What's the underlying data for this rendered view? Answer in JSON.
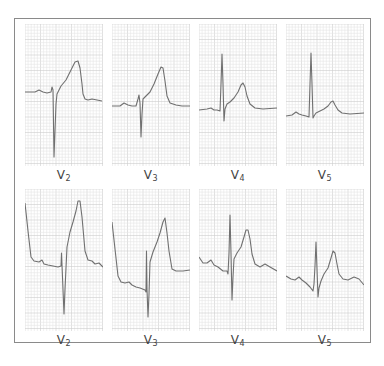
{
  "figure": {
    "colors": {
      "frame": "#8a8a8a",
      "grid_minor": "#e6e6e6",
      "grid_major": "#cdcdcd",
      "trace": "#707070",
      "label": "#444444"
    }
  },
  "rows": [
    {
      "panels": [
        {
          "lead": "V",
          "sub": "2",
          "trace": [
            [
              0,
              68
            ],
            [
              10,
              68
            ],
            [
              14,
              66
            ],
            [
              18,
              68
            ],
            [
              22,
              69
            ],
            [
              26,
              68
            ],
            [
              27,
              63
            ],
            [
              28,
              66
            ],
            [
              29,
              133
            ],
            [
              31,
              80
            ],
            [
              32,
              70
            ],
            [
              36,
              62
            ],
            [
              41,
              56
            ],
            [
              46,
              46
            ],
            [
              50,
              38
            ],
            [
              53,
              37
            ],
            [
              55,
              44
            ],
            [
              57,
              60
            ],
            [
              58,
              70
            ],
            [
              60,
              75
            ],
            [
              63,
              76
            ],
            [
              67,
              75
            ],
            [
              72,
              76
            ],
            [
              77,
              77
            ]
          ]
        },
        {
          "lead": "V",
          "sub": "3",
          "trace": [
            [
              0,
              82
            ],
            [
              8,
              82
            ],
            [
              12,
              79
            ],
            [
              16,
              81
            ],
            [
              20,
              82
            ],
            [
              24,
              82
            ],
            [
              26,
              75
            ],
            [
              27,
              71
            ],
            [
              28,
              79
            ],
            [
              29,
              113
            ],
            [
              30,
              90
            ],
            [
              31,
              75
            ],
            [
              34,
              72
            ],
            [
              38,
              68
            ],
            [
              42,
              60
            ],
            [
              46,
              50
            ],
            [
              49,
              43
            ],
            [
              51,
              44
            ],
            [
              53,
              57
            ],
            [
              55,
              72
            ],
            [
              58,
              79
            ],
            [
              64,
              81
            ],
            [
              70,
              82
            ],
            [
              78,
              82
            ]
          ]
        },
        {
          "lead": "V",
          "sub": "4",
          "trace": [
            [
              0,
              86
            ],
            [
              8,
              85
            ],
            [
              12,
              84
            ],
            [
              15,
              86
            ],
            [
              18,
              86
            ],
            [
              21,
              87
            ],
            [
              22,
              60
            ],
            [
              23,
              30
            ],
            [
              24,
              60
            ],
            [
              25,
              97
            ],
            [
              26,
              85
            ],
            [
              28,
              80
            ],
            [
              31,
              78
            ],
            [
              35,
              74
            ],
            [
              39,
              68
            ],
            [
              42,
              61
            ],
            [
              44,
              59
            ],
            [
              46,
              63
            ],
            [
              48,
              72
            ],
            [
              51,
              80
            ],
            [
              56,
              84
            ],
            [
              64,
              85
            ],
            [
              78,
              84
            ]
          ]
        },
        {
          "lead": "V",
          "sub": "5",
          "trace": [
            [
              0,
              92
            ],
            [
              6,
              91
            ],
            [
              10,
              88
            ],
            [
              13,
              90
            ],
            [
              16,
              91
            ],
            [
              20,
              92
            ],
            [
              23,
              93
            ],
            [
              24,
              60
            ],
            [
              25,
              29
            ],
            [
              26,
              60
            ],
            [
              27,
              94
            ],
            [
              28,
              92
            ],
            [
              30,
              89
            ],
            [
              34,
              87
            ],
            [
              38,
              85
            ],
            [
              42,
              82
            ],
            [
              45,
              78
            ],
            [
              47,
              77
            ],
            [
              49,
              81
            ],
            [
              52,
              86
            ],
            [
              56,
              89
            ],
            [
              64,
              90
            ],
            [
              78,
              89
            ]
          ]
        }
      ]
    },
    {
      "panels": [
        {
          "lead": "V",
          "sub": "2",
          "trace": [
            [
              0,
              14
            ],
            [
              3,
              42
            ],
            [
              6,
              68
            ],
            [
              9,
              72
            ],
            [
              14,
              73
            ],
            [
              17,
              71
            ],
            [
              19,
              75
            ],
            [
              23,
              76
            ],
            [
              28,
              77
            ],
            [
              33,
              78
            ],
            [
              36,
              77
            ],
            [
              36.5,
              64
            ],
            [
              37,
              76
            ],
            [
              39,
              125
            ],
            [
              40,
              100
            ],
            [
              42,
              58
            ],
            [
              45,
              43
            ],
            [
              48,
              33
            ],
            [
              51,
              22
            ],
            [
              53,
              12
            ],
            [
              55,
              12
            ],
            [
              57,
              28
            ],
            [
              60,
              62
            ],
            [
              63,
              71
            ],
            [
              67,
              72
            ],
            [
              70,
              75
            ],
            [
              74,
              74
            ],
            [
              78,
              78
            ]
          ]
        },
        {
          "lead": "V",
          "sub": "3",
          "trace": [
            [
              0,
              33
            ],
            [
              3,
              60
            ],
            [
              6,
              87
            ],
            [
              9,
              93
            ],
            [
              13,
              94
            ],
            [
              17,
              93
            ],
            [
              20,
              96
            ],
            [
              24,
              98
            ],
            [
              28,
              99
            ],
            [
              33,
              101
            ],
            [
              34,
              103
            ],
            [
              34.5,
              62
            ],
            [
              35,
              100
            ],
            [
              36,
              128
            ],
            [
              37,
              105
            ],
            [
              38,
              73
            ],
            [
              41,
              63
            ],
            [
              45,
              53
            ],
            [
              48,
              44
            ],
            [
              51,
              33
            ],
            [
              53,
              29
            ],
            [
              55,
              44
            ],
            [
              57,
              62
            ],
            [
              60,
              80
            ],
            [
              64,
              82
            ],
            [
              71,
              82
            ],
            [
              78,
              81
            ]
          ]
        },
        {
          "lead": "V",
          "sub": "4",
          "trace": [
            [
              0,
              68
            ],
            [
              4,
              74
            ],
            [
              8,
              74
            ],
            [
              12,
              71
            ],
            [
              15,
              76
            ],
            [
              19,
              78
            ],
            [
              24,
              82
            ],
            [
              28,
              82
            ],
            [
              29,
              85
            ],
            [
              30,
              64
            ],
            [
              31,
              26
            ],
            [
              32,
              64
            ],
            [
              33,
              111
            ],
            [
              34,
              88
            ],
            [
              35,
              70
            ],
            [
              38,
              64
            ],
            [
              42,
              58
            ],
            [
              45,
              48
            ],
            [
              47,
              41
            ],
            [
              49,
              41
            ],
            [
              51,
              50
            ],
            [
              53,
              65
            ],
            [
              56,
              75
            ],
            [
              61,
              78
            ],
            [
              66,
              75
            ],
            [
              71,
              78
            ],
            [
              78,
              82
            ]
          ]
        },
        {
          "lead": "V",
          "sub": "5",
          "trace": [
            [
              0,
              87
            ],
            [
              5,
              90
            ],
            [
              9,
              91
            ],
            [
              13,
              88
            ],
            [
              16,
              91
            ],
            [
              20,
              94
            ],
            [
              24,
              98
            ],
            [
              27,
              102
            ],
            [
              28,
              95
            ],
            [
              29,
              77
            ],
            [
              30,
              53
            ],
            [
              31,
              80
            ],
            [
              32,
              108
            ],
            [
              33,
              99
            ],
            [
              35,
              92
            ],
            [
              38,
              85
            ],
            [
              42,
              79
            ],
            [
              45,
              69
            ],
            [
              47,
              62
            ],
            [
              49,
              64
            ],
            [
              51,
              75
            ],
            [
              53,
              85
            ],
            [
              57,
              90
            ],
            [
              62,
              91
            ],
            [
              68,
              88
            ],
            [
              73,
              90
            ],
            [
              78,
              96
            ]
          ]
        }
      ]
    }
  ]
}
